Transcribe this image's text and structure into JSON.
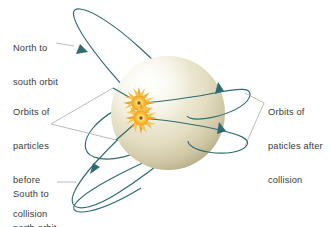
{
  "figure": {
    "type": "diagram",
    "background_color": "#ffffff"
  },
  "labels": {
    "north_to_south": {
      "line1": "North to",
      "line2": "south orbit"
    },
    "orbits_before": {
      "line1": "Orbits of",
      "line2": "particles",
      "line3": "before",
      "line4": "collision"
    },
    "south_to_north": {
      "line1": "South to",
      "line2": "north orbit"
    },
    "orbits_after": {
      "line1": "Orbits of",
      "line2": "paticles after",
      "line3": "collision"
    }
  },
  "colors": {
    "label_text": "#3b3b3b",
    "orbit_stroke": "#2e6b72",
    "leader_line": "#9aa0a6",
    "sphere_light": "#fbfaf1",
    "sphere_mid": "#ded9c0",
    "sphere_shadow": "#b9b28f",
    "burst_outer": "#f0a32a",
    "burst_inner": "#ffd95e",
    "burst_core": "#6a5a2a"
  },
  "geometry": {
    "sphere": {
      "cx": 168,
      "cy": 113,
      "r": 57
    },
    "collision_points": [
      {
        "name": "upper-collision",
        "cx": 139,
        "cy": 103
      },
      {
        "name": "lower-collision",
        "cx": 141,
        "cy": 118
      }
    ],
    "orbit_count": 4,
    "arrow_count": 4
  }
}
